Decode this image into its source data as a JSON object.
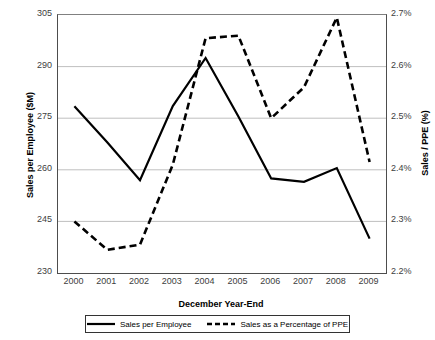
{
  "chart_data": {
    "type": "line",
    "title": "",
    "xlabel": "December Year-End",
    "ylabel": "Sales per Employee ($M)",
    "y2label": "Sales / PPE (%)",
    "categories": [
      "2000",
      "2001",
      "2002",
      "2003",
      "2004",
      "2005",
      "2006",
      "2007",
      "2008",
      "2009"
    ],
    "ylim": [
      230,
      305
    ],
    "yticks": [
      "230",
      "245",
      "260",
      "275",
      "290",
      "305"
    ],
    "y2lim": [
      2.2,
      2.7
    ],
    "y2ticks": [
      "2.2%",
      "2.3%",
      "2.4%",
      "2.5%",
      "2.6%",
      "2.7%"
    ],
    "grid": true,
    "legend_position": "bottom",
    "series": [
      {
        "name": "Sales per Employee",
        "axis": "left",
        "style": "solid",
        "color": "#000000",
        "values": [
          278.5,
          268.0,
          257.0,
          278.5,
          292.5,
          275.5,
          257.5,
          256.5,
          260.5,
          240.0
        ]
      },
      {
        "name": "Sales as a Percentage of PPE",
        "axis": "right",
        "style": "dashed",
        "color": "#000000",
        "values": [
          2.3,
          2.245,
          2.255,
          2.41,
          2.655,
          2.66,
          2.5,
          2.56,
          2.695,
          2.415
        ]
      }
    ]
  },
  "legend": {
    "entries": [
      {
        "label": "Sales per Employee",
        "style": "solid"
      },
      {
        "label": "Sales as a Percentage of PPE",
        "style": "dashed"
      }
    ]
  }
}
